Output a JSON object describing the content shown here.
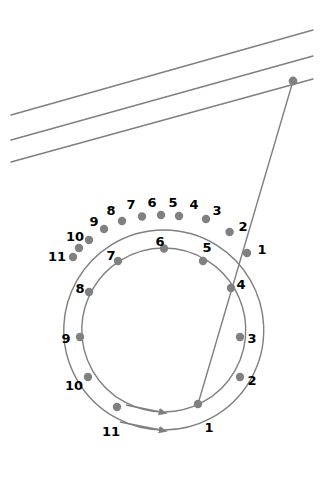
{
  "figure": {
    "title": "",
    "background_color": "#ffffff",
    "stroke_color": "#7f7f7f",
    "node_color": "#808080",
    "label_color": "#000000",
    "line_width": 1.4,
    "node_radius": 4.2,
    "label_font_size": 13
  },
  "chart_data": {
    "type": "diagram",
    "title": "",
    "geometry": {
      "center_x": 163,
      "center_y": 330,
      "outer_radius": 100,
      "inner_radius": 82,
      "points_per_circle": 12,
      "angle_step_degrees": 30
    },
    "outer_circle": {
      "name": "outer-track",
      "radius": 100,
      "labels": [
        "1",
        "2",
        "3",
        "4",
        "5",
        "6",
        "7",
        "8",
        "9",
        "10",
        "11"
      ],
      "visible_label_count": 11,
      "node_count": 12,
      "direction": "clockwise-to-counterclockwise-sweep",
      "arrow_at": "bottom"
    },
    "inner_circle": {
      "name": "inner-track",
      "radius": 82,
      "labels": [
        "1",
        "2",
        "3",
        "4",
        "5",
        "6",
        "7",
        "8",
        "9",
        "10",
        "11"
      ],
      "visible_label_count": 11,
      "node_count": 12,
      "arrow_at": "bottom"
    },
    "parallel_lines": {
      "count": 3,
      "x_start": 11,
      "x_end": 313,
      "y_start_values": [
        115,
        140,
        162
      ],
      "y_end_values": [
        30,
        56,
        79
      ]
    },
    "ray": {
      "from_label": "source-point",
      "from_x": 293,
      "from_y": 81,
      "through_x": 247,
      "through_y": 253,
      "to_x": 198,
      "to_y": 404
    }
  },
  "outer_nodes": [
    {
      "label": "1",
      "node_x": 247.0,
      "node_y": 253.0,
      "label_x": 262,
      "label_y": 250
    },
    {
      "label": "2",
      "node_x": 229.6,
      "node_y": 232.0,
      "label_x": 243,
      "label_y": 227
    },
    {
      "label": "3",
      "node_x": 206.0,
      "node_y": 219.0,
      "label_x": 217,
      "label_y": 211
    },
    {
      "label": "4",
      "node_x": 179.0,
      "node_y": 216.0,
      "label_x": 194,
      "label_y": 205
    },
    {
      "label": "5",
      "node_x": 161.0,
      "node_y": 215.0,
      "label_x": 173,
      "label_y": 203
    },
    {
      "label": "6",
      "node_x": 142.0,
      "node_y": 216.5,
      "label_x": 152,
      "label_y": 203
    },
    {
      "label": "7",
      "node_x": 122.0,
      "node_y": 221.0,
      "label_x": 131,
      "label_y": 205
    },
    {
      "label": "8",
      "node_x": 104.0,
      "node_y": 229.0,
      "label_x": 111,
      "label_y": 211
    },
    {
      "label": "9",
      "node_x": 89.0,
      "node_y": 240.0,
      "label_x": 94,
      "label_y": 222
    },
    {
      "label": "10",
      "node_x": 79.0,
      "node_y": 248.0,
      "label_x": 75,
      "label_y": 237
    },
    {
      "label": "11",
      "node_x": 73.0,
      "node_y": 257.0,
      "label_x": 57,
      "label_y": 257
    }
  ],
  "inner_nodes": [
    {
      "label": "1",
      "node_x": 198.0,
      "node_y": 404.0,
      "label_x": 209,
      "label_y": 428
    },
    {
      "label": "2",
      "node_x": 240.0,
      "node_y": 377.0,
      "label_x": 252,
      "label_y": 381
    },
    {
      "label": "3",
      "node_x": 240.0,
      "node_y": 337.0,
      "label_x": 252,
      "label_y": 339
    },
    {
      "label": "4",
      "node_x": 231.0,
      "node_y": 288.0,
      "label_x": 241,
      "label_y": 285
    },
    {
      "label": "5",
      "node_x": 203.0,
      "node_y": 261.0,
      "label_x": 207,
      "label_y": 248
    },
    {
      "label": "6",
      "node_x": 164.0,
      "node_y": 248.5,
      "label_x": 160,
      "label_y": 242
    },
    {
      "label": "7",
      "node_x": 118.0,
      "node_y": 261.0,
      "label_x": 111,
      "label_y": 256
    },
    {
      "label": "8",
      "node_x": 89.0,
      "node_y": 292.0,
      "label_x": 80,
      "label_y": 289
    },
    {
      "label": "9",
      "node_x": 80.0,
      "node_y": 337.0,
      "label_x": 66,
      "label_y": 339
    },
    {
      "label": "10",
      "node_x": 88.0,
      "node_y": 377.0,
      "label_x": 74,
      "label_y": 386
    },
    {
      "label": "11",
      "node_x": 117.0,
      "node_y": 407.0,
      "label_x": 111,
      "label_y": 432
    }
  ],
  "source_node": {
    "name": "ray-origin",
    "x": 293,
    "y": 81
  }
}
